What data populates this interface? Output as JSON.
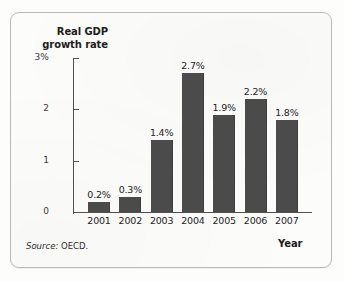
{
  "figure": {
    "source_prefix": "Source:",
    "source_value": "OECD."
  },
  "chart_data": {
    "type": "bar",
    "title": "",
    "ylabel": "Real GDP growth rate",
    "xlabel": "Year",
    "categories": [
      "2001",
      "2002",
      "2003",
      "2004",
      "2005",
      "2006",
      "2007"
    ],
    "values": [
      0.2,
      0.3,
      1.4,
      2.7,
      1.9,
      2.2,
      1.8
    ],
    "value_labels": [
      "0.2%",
      "0.3%",
      "1.4%",
      "2.7%",
      "1.9%",
      "2.2%",
      "1.8%"
    ],
    "ylim": [
      0,
      3
    ],
    "yticks": [
      0,
      1,
      2,
      3
    ],
    "ytick_labels": [
      "0",
      "1",
      "2",
      "3%"
    ],
    "grid": false,
    "legend": "none",
    "bar_color": "#4c4b4b",
    "axis_color": "#53514f"
  }
}
